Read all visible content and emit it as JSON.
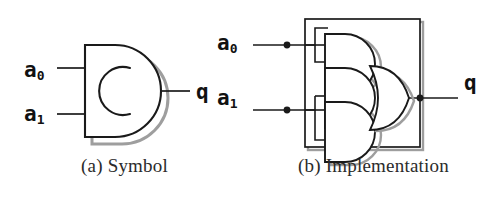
{
  "figure": {
    "kind": "logic-circuit-diagram",
    "background_color": "#ffffff",
    "line_color": "#1a1a1a",
    "shadow_color": "#9a9a9a",
    "caption_color": "#2b2b2b"
  },
  "panel_a": {
    "caption": "(a) Symbol",
    "inputs": [
      {
        "name": "a0",
        "base": "a",
        "subscript": "0"
      },
      {
        "name": "a1",
        "base": "a",
        "subscript": "1"
      }
    ],
    "output": {
      "name": "q",
      "label": "q"
    },
    "symbol": {
      "shape": "d-shape-block",
      "inner_glyph": "c-arc"
    }
  },
  "panel_b": {
    "caption": "(b) Implementation",
    "inputs": [
      {
        "name": "a0",
        "base": "a",
        "subscript": "0"
      },
      {
        "name": "a1",
        "base": "a",
        "subscript": "1"
      }
    ],
    "output": {
      "name": "q",
      "label": "q"
    },
    "gates": [
      {
        "id": "and-gate-top",
        "type": "and"
      },
      {
        "id": "and-gate-middle",
        "type": "and"
      },
      {
        "id": "and-gate-bottom",
        "type": "and"
      },
      {
        "id": "or-gate",
        "type": "or"
      }
    ],
    "junctions": [
      {
        "id": "junction-a0",
        "on": "a0"
      },
      {
        "id": "junction-a1",
        "on": "a1"
      },
      {
        "id": "junction-q",
        "on": "q"
      }
    ],
    "enclosure": {
      "id": "module-boundary-box"
    }
  }
}
